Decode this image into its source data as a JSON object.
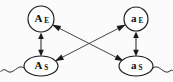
{
  "diagram": {
    "background_color": "#fbfbfb",
    "stroke_color": "#1a1a1a",
    "nodes": [
      {
        "id": "A_E",
        "base": "A",
        "subscript": "E",
        "shape": "circle",
        "position": "top-left",
        "cx": 41,
        "cy": 19,
        "r": 13
      },
      {
        "id": "a_E",
        "base": "a",
        "subscript": "E",
        "shape": "circle",
        "position": "top-right",
        "cx": 136,
        "cy": 19,
        "r": 12
      },
      {
        "id": "A_S",
        "base": "A",
        "subscript": "S",
        "shape": "ellipse",
        "position": "bottom-left",
        "cx": 41,
        "cy": 66,
        "rx": 17,
        "ry": 10
      },
      {
        "id": "a_S",
        "base": "a",
        "subscript": "S",
        "shape": "ellipse",
        "position": "bottom-right",
        "cx": 136,
        "cy": 66,
        "rx": 17,
        "ry": 10
      }
    ],
    "edges": [
      {
        "id": "edge-AE-AS",
        "from": "A_E",
        "to": "A_S",
        "style": "straight",
        "direction": "bidirectional"
      },
      {
        "id": "edge-aE-aS",
        "from": "a_E",
        "to": "a_S",
        "style": "straight",
        "direction": "bidirectional"
      },
      {
        "id": "edge-AE-aS",
        "from": "A_E",
        "to": "a_S",
        "style": "diagonal",
        "direction": "bidirectional"
      },
      {
        "id": "edge-aE-AS",
        "from": "a_E",
        "to": "A_S",
        "style": "diagonal",
        "direction": "bidirectional"
      }
    ],
    "tails": [
      {
        "id": "tail-left",
        "attached_to": "A_S",
        "side": "left",
        "style": "wavy"
      },
      {
        "id": "tail-right",
        "attached_to": "a_S",
        "side": "right",
        "style": "wavy"
      }
    ]
  }
}
